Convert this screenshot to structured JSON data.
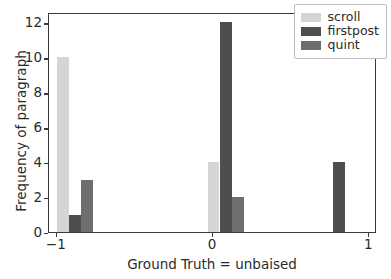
{
  "chart_data": {
    "type": "bar",
    "title": "",
    "subtitle": "",
    "xlabel": "Ground Truth = unbaised",
    "ylabel": "Frequency of paragraph",
    "xlim": [
      -1.05,
      1.05
    ],
    "ylim": [
      0,
      12.6
    ],
    "xticks": [
      -1,
      0,
      1
    ],
    "xtick_labels": [
      "−1",
      "0",
      "1"
    ],
    "yticks": [
      0,
      2,
      4,
      6,
      8,
      10,
      12
    ],
    "ytick_labels": [
      "0",
      "2",
      "4",
      "6",
      "8",
      "10",
      "12"
    ],
    "grid": false,
    "legend_position": "upper right",
    "bar_width": 0.075,
    "series": [
      {
        "name": "scroll",
        "color": "#d5d5d5",
        "bars": [
          {
            "x": -0.962,
            "value": 10
          },
          {
            "x": 0.004,
            "value": 4
          }
        ]
      },
      {
        "name": "firstpost",
        "color": "#4e4e4e",
        "bars": [
          {
            "x": -0.884,
            "value": 1
          },
          {
            "x": 0.082,
            "value": 12
          },
          {
            "x": 0.808,
            "value": 4
          }
        ]
      },
      {
        "name": "quint",
        "color": "#6e6e6e",
        "bars": [
          {
            "x": -0.806,
            "value": 3
          },
          {
            "x": 0.16,
            "value": 2
          }
        ]
      }
    ],
    "legend": [
      {
        "label": "scroll",
        "color": "#d5d5d5"
      },
      {
        "label": "firstpost",
        "color": "#4e4e4e"
      },
      {
        "label": "quint",
        "color": "#6e6e6e"
      }
    ]
  }
}
